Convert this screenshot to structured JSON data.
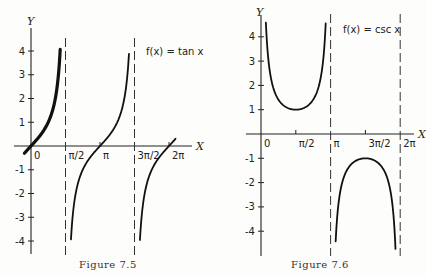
{
  "chart_data": [
    {
      "type": "line",
      "title": "f(x) = tan x",
      "caption": "Figure 7.5",
      "function": "tan",
      "xlabel": "X",
      "ylabel": "Y",
      "xlim": [
        -0.4,
        6.6
      ],
      "ylim": [
        -4.5,
        4.6
      ],
      "x_ticks": [
        {
          "value": 0,
          "label": "0"
        },
        {
          "value": 1.5708,
          "label": "π/2"
        },
        {
          "value": 3.1416,
          "label": "π"
        },
        {
          "value": 4.7124,
          "label": "3π/2"
        },
        {
          "value": 6.2832,
          "label": "2π"
        }
      ],
      "y_ticks": [
        {
          "value": 4,
          "label": "4"
        },
        {
          "value": 3,
          "label": "3"
        },
        {
          "value": 2,
          "label": "2"
        },
        {
          "value": 1,
          "label": "1"
        },
        {
          "value": -1,
          "label": "-1"
        },
        {
          "value": -2,
          "label": "-2"
        },
        {
          "value": -3,
          "label": "-3"
        },
        {
          "value": -4,
          "label": "-4"
        }
      ],
      "asymptotes": [
        1.5708,
        4.7124
      ],
      "series": [
        {
          "name": "tan-branch-1",
          "x_range": [
            -0.3,
            1.33
          ],
          "emphasized": true
        },
        {
          "name": "tan-branch-2",
          "x_range": [
            1.82,
            4.46
          ],
          "emphasized": false
        },
        {
          "name": "tan-branch-3",
          "x_range": [
            4.96,
            6.58
          ],
          "emphasized": false
        }
      ],
      "legend": "top-right"
    },
    {
      "type": "line",
      "title": "f(x) = csc x",
      "caption": "Figure 7.6",
      "function": "csc",
      "xlabel": "X",
      "ylabel": "Y",
      "xlim": [
        -0.2,
        6.7
      ],
      "ylim": [
        -5,
        4.8
      ],
      "x_ticks": [
        {
          "value": 0,
          "label": "0"
        },
        {
          "value": 1.5708,
          "label": "π/2"
        },
        {
          "value": 3.1416,
          "label": "π"
        },
        {
          "value": 4.7124,
          "label": "3π/2"
        },
        {
          "value": 6.2832,
          "label": "2π"
        }
      ],
      "y_ticks": [
        {
          "value": 4,
          "label": "4"
        },
        {
          "value": 3,
          "label": "3"
        },
        {
          "value": 2,
          "label": "2"
        },
        {
          "value": 1,
          "label": "1"
        },
        {
          "value": -1,
          "label": "-1"
        },
        {
          "value": -2,
          "label": "-2"
        },
        {
          "value": -3,
          "label": "-3"
        },
        {
          "value": -4,
          "label": "-4"
        }
      ],
      "asymptotes": [
        3.1416,
        6.2832
      ],
      "series": [
        {
          "name": "csc-branch-1",
          "x_range": [
            0.22,
            2.92
          ],
          "emphasized": false
        },
        {
          "name": "csc-branch-2",
          "x_range": [
            3.37,
            6.07
          ],
          "emphasized": false
        }
      ],
      "legend": "top-right"
    }
  ]
}
